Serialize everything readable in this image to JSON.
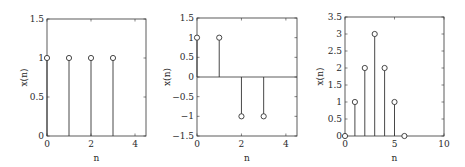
{
  "chart_data": [
    {
      "type": "stem",
      "title": "",
      "xlabel": "n",
      "ylabel": "x(n)",
      "xlim": [
        0,
        4.5
      ],
      "ylim": [
        0,
        1.5
      ],
      "xticks": [
        0,
        2,
        4
      ],
      "yticks": [
        0,
        0.5,
        1,
        1.5
      ],
      "ytick_labels": [
        "0",
        "0.5",
        "1",
        "1.5"
      ],
      "x": [
        0,
        1,
        2,
        3
      ],
      "values": [
        1,
        1,
        1,
        1
      ],
      "grid": false,
      "frame": {
        "left": 47,
        "right": 146,
        "top": 19,
        "bottom": 136
      }
    },
    {
      "type": "stem",
      "title": "",
      "xlabel": "n",
      "ylabel": "x(n)",
      "xlim": [
        0,
        4.5
      ],
      "ylim": [
        -1.5,
        1.5
      ],
      "xticks": [
        0,
        2,
        4
      ],
      "yticks": [
        -1.5,
        -1,
        -0.5,
        0,
        0.5,
        1,
        1.5
      ],
      "ytick_labels": [
        "−1.5",
        "−1",
        "−0.5",
        "0",
        "0.5",
        "1",
        "1.5"
      ],
      "x": [
        0,
        1,
        2,
        3
      ],
      "values": [
        1,
        1,
        -1,
        -1
      ],
      "grid": false,
      "baseline": 0,
      "frame": {
        "left": 197,
        "right": 297,
        "top": 18,
        "bottom": 136
      }
    },
    {
      "type": "stem",
      "title": "",
      "xlabel": "n",
      "ylabel": "x(n)",
      "xlim": [
        0,
        10
      ],
      "ylim": [
        0,
        3.5
      ],
      "xticks": [
        0,
        5,
        10
      ],
      "yticks": [
        0,
        0.5,
        1,
        1.5,
        2,
        2.5,
        3,
        3.5
      ],
      "ytick_labels": [
        "0",
        "0.5",
        "1",
        "1.5",
        "2",
        "2.5",
        "3",
        "3.5"
      ],
      "x": [
        0,
        1,
        2,
        3,
        4,
        5,
        6
      ],
      "values": [
        0,
        1,
        2,
        3,
        2,
        1,
        0
      ],
      "grid": false,
      "frame": {
        "left": 345,
        "right": 444,
        "top": 17,
        "bottom": 136
      }
    }
  ],
  "style": {
    "axis_color": "#333333",
    "stem_color": "#333333",
    "marker_color": "#333333",
    "background": "#ffffff"
  }
}
